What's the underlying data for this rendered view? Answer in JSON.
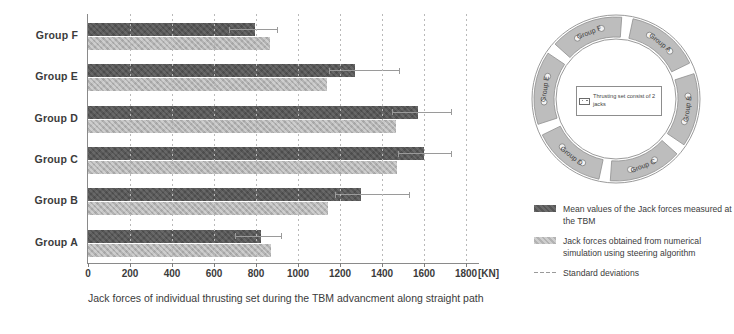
{
  "chart_data": {
    "type": "bar",
    "orientation": "horizontal",
    "title": "",
    "xlabel": "Jack forces of individual thrusting set during the TBM advancment along straight path",
    "ylabel": "",
    "xunit": "[KN]",
    "xlim": [
      0,
      1800
    ],
    "xticks": [
      0,
      200,
      400,
      600,
      800,
      1000,
      1200,
      1400,
      1600,
      1800
    ],
    "grid": true,
    "legend_position": "right",
    "categories": [
      "Group A",
      "Group B",
      "Group C",
      "Group D",
      "Group E",
      "Group F"
    ],
    "series": [
      {
        "name": "Mean values of the Jack forces measured at the TBM",
        "color": "#575757",
        "values": [
          825,
          1300,
          1600,
          1570,
          1270,
          795
        ],
        "errors_upper": [
          925,
          1535,
          1735,
          1735,
          1485,
          905
        ]
      },
      {
        "name": "Jack forces obtained from numerical simulation using steering algorithm",
        "color": "#b3b3b3",
        "values": [
          870,
          1145,
          1470,
          1465,
          1140,
          865
        ]
      }
    ],
    "error_series_name": "Standard deviations"
  },
  "xaxis": {
    "ticks": [
      "0",
      "200",
      "400",
      "600",
      "800",
      "1000",
      "1200",
      "1400",
      "1600",
      "1800"
    ],
    "unit": "[KN]",
    "caption": "Jack forces of individual thrusting set during the TBM advancment along straight path"
  },
  "yaxis": {
    "labels": [
      "Group F",
      "Group E",
      "Group D",
      "Group C",
      "Group B",
      "Group A"
    ]
  },
  "ring": {
    "segments": [
      {
        "label": "Group A"
      },
      {
        "label": "Group B"
      },
      {
        "label": "Group C"
      },
      {
        "label": "Group D"
      },
      {
        "label": "Group E"
      },
      {
        "label": "Group F"
      }
    ],
    "center_note": "Thrusting set consist of 2 jacks"
  },
  "legend": {
    "items": [
      {
        "swatch": "mean",
        "text": "Mean values of the Jack forces measured at the TBM"
      },
      {
        "swatch": "sim",
        "text": "Jack forces obtained from numerical simulation using steering algorithm"
      },
      {
        "swatch": "std",
        "text": "Standard deviations"
      }
    ]
  },
  "colors": {
    "mean_bar": "#575757",
    "sim_bar": "#b3b3b3",
    "error_line": "#9a9a9a",
    "axis": "#8a8a8a",
    "grid": "#b9b9b9",
    "text": "#3b3b3b",
    "background": "#ffffff"
  }
}
